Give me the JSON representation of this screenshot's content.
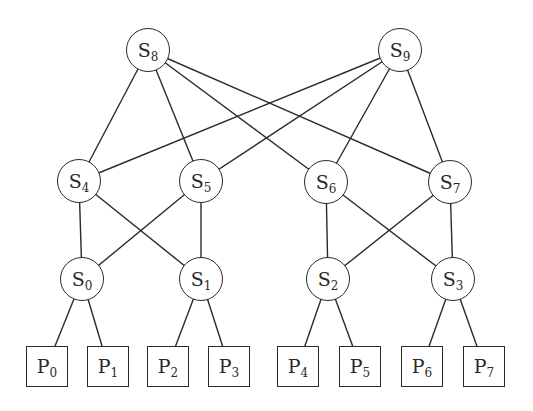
{
  "diagram": {
    "type": "network-topology",
    "style": {
      "line_color": "#2a2a2a",
      "background": "#ffffff"
    },
    "switches": [
      {
        "id": "S8",
        "prefix": "S",
        "index": "8",
        "x": 148,
        "y": 50
      },
      {
        "id": "S9",
        "prefix": "S",
        "index": "9",
        "x": 400,
        "y": 50
      },
      {
        "id": "S4",
        "prefix": "S",
        "index": "4",
        "x": 79,
        "y": 181
      },
      {
        "id": "S5",
        "prefix": "S",
        "index": "5",
        "x": 201,
        "y": 181
      },
      {
        "id": "S6",
        "prefix": "S",
        "index": "6",
        "x": 326,
        "y": 182
      },
      {
        "id": "S7",
        "prefix": "S",
        "index": "7",
        "x": 450,
        "y": 182
      },
      {
        "id": "S0",
        "prefix": "S",
        "index": "0",
        "x": 82,
        "y": 279
      },
      {
        "id": "S1",
        "prefix": "S",
        "index": "1",
        "x": 201,
        "y": 279
      },
      {
        "id": "S2",
        "prefix": "S",
        "index": "2",
        "x": 328,
        "y": 279
      },
      {
        "id": "S3",
        "prefix": "S",
        "index": "3",
        "x": 453,
        "y": 279
      }
    ],
    "processors": [
      {
        "id": "P0",
        "prefix": "P",
        "index": "0",
        "x": 47,
        "y": 366
      },
      {
        "id": "P1",
        "prefix": "P",
        "index": "1",
        "x": 108,
        "y": 366
      },
      {
        "id": "P2",
        "prefix": "P",
        "index": "2",
        "x": 168,
        "y": 366
      },
      {
        "id": "P3",
        "prefix": "P",
        "index": "3",
        "x": 229,
        "y": 366
      },
      {
        "id": "P4",
        "prefix": "P",
        "index": "4",
        "x": 298,
        "y": 366
      },
      {
        "id": "P5",
        "prefix": "P",
        "index": "5",
        "x": 360,
        "y": 366
      },
      {
        "id": "P6",
        "prefix": "P",
        "index": "6",
        "x": 422,
        "y": 366
      },
      {
        "id": "P7",
        "prefix": "P",
        "index": "7",
        "x": 484,
        "y": 366
      }
    ],
    "edges": [
      [
        "S8",
        "S4"
      ],
      [
        "S8",
        "S5"
      ],
      [
        "S8",
        "S6"
      ],
      [
        "S8",
        "S7"
      ],
      [
        "S9",
        "S4"
      ],
      [
        "S9",
        "S5"
      ],
      [
        "S9",
        "S6"
      ],
      [
        "S9",
        "S7"
      ],
      [
        "S4",
        "S0"
      ],
      [
        "S4",
        "S1"
      ],
      [
        "S5",
        "S0"
      ],
      [
        "S5",
        "S1"
      ],
      [
        "S6",
        "S2"
      ],
      [
        "S6",
        "S3"
      ],
      [
        "S7",
        "S2"
      ],
      [
        "S7",
        "S3"
      ],
      [
        "S0",
        "P0"
      ],
      [
        "S0",
        "P1"
      ],
      [
        "S1",
        "P2"
      ],
      [
        "S1",
        "P3"
      ],
      [
        "S2",
        "P4"
      ],
      [
        "S2",
        "P5"
      ],
      [
        "S3",
        "P6"
      ],
      [
        "S3",
        "P7"
      ]
    ]
  }
}
